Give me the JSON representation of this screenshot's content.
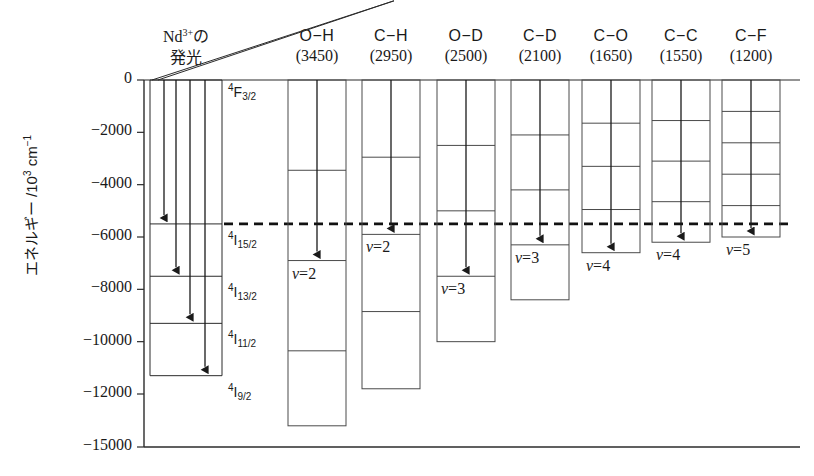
{
  "figure": {
    "y_axis": {
      "label": "エネルギー /10³ cm⁻¹",
      "ticks": [
        {
          "text": "0",
          "value": 0
        },
        {
          "text": "−2000",
          "value": -2000
        },
        {
          "text": "−4000",
          "value": -4000
        },
        {
          "text": "−6000",
          "value": -6000
        },
        {
          "text": "−8000",
          "value": -8000
        },
        {
          "text": "−10000",
          "value": -10000
        },
        {
          "text": "−12000",
          "value": -12000
        },
        {
          "text": "−15000",
          "value": -15000
        }
      ]
    },
    "nd_panel": {
      "title_line1": "Nd³⁺の",
      "title_line2": "発光",
      "levels": [
        {
          "label_html": "<sup>4</sup>F<sub>3/2</sub>",
          "value": 0
        },
        {
          "label_html": "<sup>4</sup>I<sub>15/2</sub>",
          "value": -5500
        },
        {
          "label_html": "<sup>4</sup>I<sub>13/2</sub>",
          "value": -7500
        },
        {
          "label_html": "<sup>4</sup>I<sub>11/2</sub>",
          "value": -9300
        },
        {
          "label_html": "<sup>4</sup>I<sub>9/2</sub>",
          "value": -11300
        }
      ],
      "transitions": [
        -5500,
        -7500,
        -9300,
        -11300
      ]
    },
    "dashed_line": {
      "value": -5500
    },
    "columns": [
      {
        "bond": "O−H",
        "freq": "(3450)",
        "quantum": 3450,
        "levels": 4,
        "arrow_v": 2,
        "v_label": "v",
        "v_value": "2"
      },
      {
        "bond": "C−H",
        "freq": "(2950)",
        "quantum": 2950,
        "levels": 4,
        "arrow_v": 2,
        "v_label": "v",
        "v_value": "2"
      },
      {
        "bond": "O−D",
        "freq": "(2500)",
        "quantum": 2500,
        "levels": 4,
        "arrow_v": 3,
        "v_label": "v",
        "v_value": "3"
      },
      {
        "bond": "C−D",
        "freq": "(2100)",
        "quantum": 2100,
        "levels": 4,
        "arrow_v": 3,
        "v_label": "v",
        "v_value": "3"
      },
      {
        "bond": "C−O",
        "freq": "(1650)",
        "quantum": 1650,
        "levels": 4,
        "arrow_v": 4,
        "v_label": "v",
        "v_value": "4"
      },
      {
        "bond": "C−C",
        "freq": "(1550)",
        "quantum": 1550,
        "levels": 4,
        "arrow_v": 4,
        "v_label": "v",
        "v_value": "4"
      },
      {
        "bond": "C−F",
        "freq": "(1200)",
        "quantum": 1200,
        "levels": 5,
        "arrow_v": 5,
        "v_label": "v",
        "v_value": "5"
      }
    ],
    "colors": {
      "line": "#2b2b2b",
      "box": "#4a4a4a",
      "text": "#1a1a1a",
      "background": "#ffffff"
    }
  },
  "chart_data": {
    "type": "diagram",
    "ylabel": "エネルギー /10³ cm⁻¹",
    "ylim": [
      -15000,
      0
    ],
    "yticks": [
      0,
      -2000,
      -4000,
      -6000,
      -8000,
      -10000,
      -12000,
      -15000
    ],
    "nd_levels": {
      "4F3/2": 0,
      "4I15/2": -5500,
      "4I13/2": -7500,
      "4I11/2": -9300,
      "4I9/2": -11300
    },
    "dashed_reference": -5500,
    "oscillators": [
      {
        "bond": "O−H",
        "wavenumber": 3450,
        "n_quanta_shown": 4,
        "arrow_end": -6900,
        "v": 2
      },
      {
        "bond": "C−H",
        "wavenumber": 2950,
        "n_quanta_shown": 4,
        "arrow_end": -5900,
        "v": 2
      },
      {
        "bond": "O−D",
        "wavenumber": 2500,
        "n_quanta_shown": 4,
        "arrow_end": -7500,
        "v": 3
      },
      {
        "bond": "C−D",
        "wavenumber": 2100,
        "n_quanta_shown": 4,
        "arrow_end": -6300,
        "v": 3
      },
      {
        "bond": "C−O",
        "wavenumber": 1650,
        "n_quanta_shown": 4,
        "arrow_end": -6600,
        "v": 4
      },
      {
        "bond": "C−C",
        "wavenumber": 1550,
        "n_quanta_shown": 4,
        "arrow_end": -6200,
        "v": 4
      },
      {
        "bond": "C−F",
        "wavenumber": 1200,
        "n_quanta_shown": 5,
        "arrow_end": -6000,
        "v": 5
      }
    ]
  }
}
